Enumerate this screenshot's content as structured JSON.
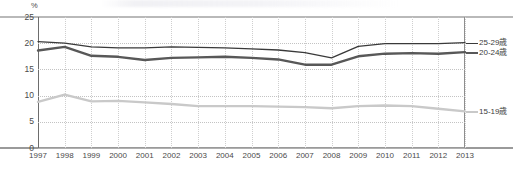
{
  "chart_data": {
    "type": "line",
    "title": "",
    "xlabel": "",
    "ylabel": "%",
    "unit_label": "%",
    "ylim": [
      0,
      25
    ],
    "yticks": [
      0,
      5,
      10,
      15,
      20,
      25
    ],
    "grid": true,
    "legend_position": "right",
    "categories": [
      "1997",
      "1998",
      "1999",
      "2000",
      "2001",
      "2002",
      "2003",
      "2004",
      "2005",
      "2006",
      "2007",
      "2008",
      "2009",
      "2010",
      "2011",
      "2012",
      "2013"
    ],
    "series": [
      {
        "name": "25-29歳",
        "color": "#3a3a3a",
        "width": 1.3,
        "values": [
          20.3,
          20.0,
          19.3,
          19.1,
          19.1,
          19.3,
          19.2,
          19.1,
          18.9,
          18.7,
          18.2,
          17.2,
          19.4,
          19.9,
          19.9,
          19.9,
          20.1
        ]
      },
      {
        "name": "20-24歳",
        "color": "#585858",
        "width": 2.4,
        "values": [
          18.6,
          19.3,
          17.6,
          17.4,
          16.8,
          17.2,
          17.3,
          17.4,
          17.2,
          16.9,
          15.9,
          15.9,
          17.5,
          18.0,
          18.1,
          18.0,
          18.3
        ]
      },
      {
        "name": "15-19歳",
        "color": "#c9c9c9",
        "width": 2.4,
        "values": [
          8.8,
          10.2,
          8.9,
          9.0,
          8.7,
          8.4,
          8.0,
          8.0,
          8.0,
          7.9,
          7.8,
          7.6,
          8.0,
          8.1,
          8.0,
          7.5,
          7.0
        ]
      }
    ]
  },
  "legend": {
    "entries": [
      {
        "label": "25-29歳"
      },
      {
        "label": "20-24歳"
      },
      {
        "label": "15-19歳"
      }
    ]
  },
  "axes": {
    "y_unit": "%",
    "y_tick_labels": [
      "25",
      "20",
      "15",
      "10",
      "5",
      "0"
    ],
    "x_tick_labels": [
      "1997",
      "1998",
      "1999",
      "2000",
      "2001",
      "2002",
      "2003",
      "2004",
      "2005",
      "2006",
      "2007",
      "2008",
      "2009",
      "2010",
      "2011",
      "2012",
      "2013"
    ]
  }
}
